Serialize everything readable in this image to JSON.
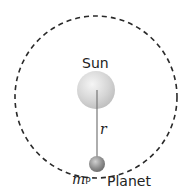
{
  "diagram": {
    "labels": {
      "sun": "Sun",
      "radius": "r",
      "planet_mass": "m",
      "planet_mass_sub": "P",
      "planet": "Planet"
    },
    "colors": {
      "orbit": "#2a2a2a",
      "sun": "#d4d4d4",
      "planet": "#8a8a8a",
      "radius_line": "#777777"
    }
  }
}
